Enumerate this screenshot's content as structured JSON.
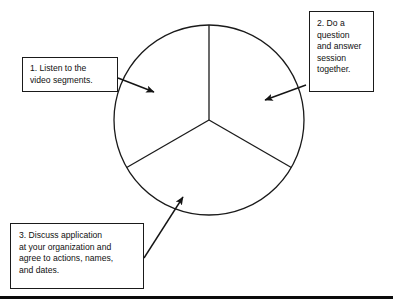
{
  "diagram": {
    "background_color": "#ffffff",
    "line_color": "#1a1a1a",
    "text_color": "#101010",
    "circle": {
      "center_x": 209,
      "center_y": 120,
      "radius": 95,
      "segment_count": 3,
      "divider_angles_deg": [
        90,
        210,
        330
      ]
    },
    "callouts": [
      {
        "id": "callout-1",
        "number": "1.",
        "text": "1. Listen to the\nvideo segments.",
        "x": 22,
        "y": 57,
        "width": 96,
        "height": 35
      },
      {
        "id": "callout-2",
        "number": "2.",
        "text": "2. Do a\nquestion\nand answer\nsession\ntogether.",
        "x": 309,
        "y": 11,
        "width": 65,
        "height": 81
      },
      {
        "id": "callout-3",
        "number": "3.",
        "text": "3. Discuss application\nat your organization and\nagree to actions, names,\nand dates.",
        "x": 10,
        "y": 223,
        "width": 134,
        "height": 66
      }
    ],
    "arrows": [
      {
        "id": "arrow-1",
        "from_callout": "callout-1",
        "start_x": 118,
        "start_y": 78,
        "tip_x": 157,
        "tip_y": 93
      },
      {
        "id": "arrow-2",
        "from_callout": "callout-2",
        "start_x": 306,
        "start_y": 85,
        "tip_x": 261,
        "tip_y": 101
      },
      {
        "id": "arrow-3",
        "from_callout": "callout-3",
        "start_x": 144,
        "start_y": 258,
        "tip_x": 181,
        "tip_y": 193
      }
    ],
    "bottom_rule": {
      "y": 296,
      "height": 3,
      "color": "#0a0a0a"
    }
  }
}
